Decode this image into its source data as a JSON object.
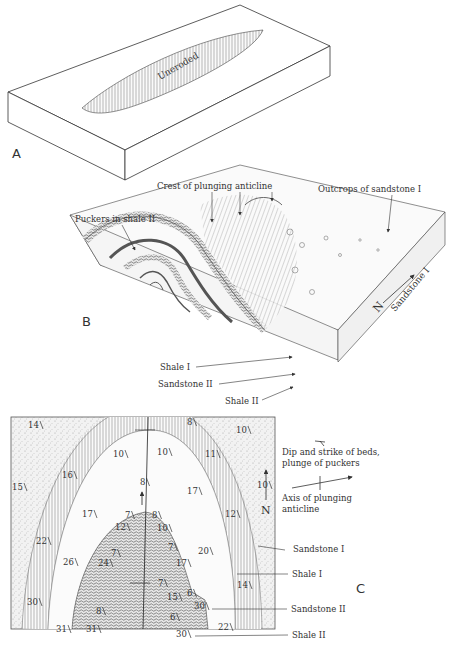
{
  "figure": {
    "panels": [
      {
        "letter": "A",
        "labels": [
          "Uneroded"
        ]
      },
      {
        "letter": "B",
        "labels": {
          "crest": "Crest of plunging anticline",
          "outcrops": "Outcrops of sandstone I",
          "puckers": "Puckers in shale II",
          "shale1": "Shale I",
          "sandstone2": "Sandstone II",
          "shale2": "Shale II",
          "sandstone1": "Sandstone I",
          "north": "N"
        }
      },
      {
        "letter": "C",
        "legend": {
          "dip_strike": "Dip and strike of beds,",
          "dip_strike2": "plunge of puckers",
          "axis": "Axis of plunging",
          "axis2": "anticline"
        },
        "north": "N",
        "units": {
          "sandstone1": "Sandstone I",
          "shale1": "Shale I",
          "sandstone2": "Sandstone II",
          "shale2": "Shale II"
        },
        "dip_values": [
          {
            "v": "14",
            "x": 28,
            "y": 428
          },
          {
            "v": "8",
            "x": 187,
            "y": 425
          },
          {
            "v": "10",
            "x": 236,
            "y": 433
          },
          {
            "v": "10",
            "x": 113,
            "y": 457
          },
          {
            "v": "10",
            "x": 157,
            "y": 455
          },
          {
            "v": "11",
            "x": 205,
            "y": 457
          },
          {
            "v": "16",
            "x": 62,
            "y": 478
          },
          {
            "v": "8",
            "x": 140,
            "y": 485
          },
          {
            "v": "15",
            "x": 12,
            "y": 490
          },
          {
            "v": "10",
            "x": 257,
            "y": 488
          },
          {
            "v": "17",
            "x": 187,
            "y": 494
          },
          {
            "v": "17",
            "x": 82,
            "y": 517
          },
          {
            "v": "7",
            "x": 125,
            "y": 518
          },
          {
            "v": "8",
            "x": 152,
            "y": 518
          },
          {
            "v": "12",
            "x": 225,
            "y": 517
          },
          {
            "v": "12",
            "x": 115,
            "y": 530
          },
          {
            "v": "10",
            "x": 157,
            "y": 531
          },
          {
            "v": "22",
            "x": 36,
            "y": 544
          },
          {
            "v": "7",
            "x": 168,
            "y": 550
          },
          {
            "v": "20",
            "x": 198,
            "y": 554
          },
          {
            "v": "7",
            "x": 111,
            "y": 556
          },
          {
            "v": "26",
            "x": 63,
            "y": 565
          },
          {
            "v": "24",
            "x": 98,
            "y": 566
          },
          {
            "v": "17",
            "x": 176,
            "y": 566
          },
          {
            "v": "7",
            "x": 158,
            "y": 586
          },
          {
            "v": "14",
            "x": 237,
            "y": 588
          },
          {
            "v": "15",
            "x": 167,
            "y": 600
          },
          {
            "v": "6",
            "x": 187,
            "y": 596
          },
          {
            "v": "30",
            "x": 27,
            "y": 605
          },
          {
            "v": "30",
            "x": 194,
            "y": 609
          },
          {
            "v": "8",
            "x": 96,
            "y": 614
          },
          {
            "v": "6",
            "x": 170,
            "y": 620
          },
          {
            "v": "31",
            "x": 56,
            "y": 632
          },
          {
            "v": "31",
            "x": 86,
            "y": 632
          },
          {
            "v": "22",
            "x": 218,
            "y": 630
          },
          {
            "v": "30",
            "x": 176,
            "y": 637
          }
        ]
      }
    ]
  },
  "colors": {
    "ink": "#333333",
    "paper": "#ffffff",
    "stipple": "#ececec"
  }
}
